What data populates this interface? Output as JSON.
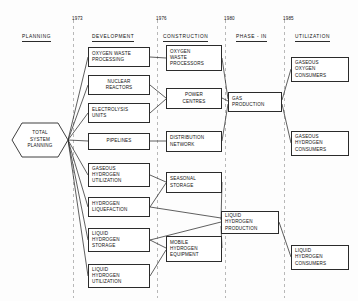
{
  "diagram": {
    "phases": [
      {
        "label": "PLANNING",
        "x": 22,
        "y": 34
      },
      {
        "label": "DEVELOPMENT",
        "x": 92,
        "y": 34
      },
      {
        "label": "CONSTRUCTION",
        "x": 163,
        "y": 34
      },
      {
        "label": "PHASE - IN",
        "x": 236,
        "y": 34
      },
      {
        "label": "UTILIZATION",
        "x": 295,
        "y": 34
      }
    ],
    "years": [
      {
        "label": "1973",
        "x": 72,
        "y": 16
      },
      {
        "label": "1976",
        "x": 156,
        "y": 16
      },
      {
        "label": "1980",
        "x": 224,
        "y": 16
      },
      {
        "label": "1985",
        "x": 283,
        "y": 16
      }
    ],
    "dividers": [
      {
        "x": 73.5
      },
      {
        "x": 157.5
      },
      {
        "x": 225.5
      },
      {
        "x": 284.5
      }
    ],
    "root": {
      "id": "total-system-planning",
      "lines": [
        "TOTAL",
        "SYSTEM",
        "PLANNING"
      ],
      "x": 12,
      "y": 123,
      "w": 56,
      "h": 34
    },
    "nodes": [
      {
        "id": "oxygen-waste-processing",
        "column": "development",
        "lines": [
          "OXYGEN WASTE",
          "PROCESSING"
        ],
        "x": 88,
        "y": 47,
        "w": 62,
        "h": 20
      },
      {
        "id": "nuclear-reactors",
        "column": "development",
        "lines": [
          "NUCLEAR",
          "REACTORS"
        ],
        "x": 88,
        "y": 75,
        "w": 62,
        "h": 20,
        "centered": true
      },
      {
        "id": "electrolysis-units",
        "column": "development",
        "lines": [
          "ELECTROLYSIS",
          "UNITS"
        ],
        "x": 88,
        "y": 103,
        "w": 62,
        "h": 20
      },
      {
        "id": "pipelines",
        "column": "development",
        "lines": [
          "PIPELINES"
        ],
        "x": 88,
        "y": 133,
        "w": 62,
        "h": 17,
        "centered": true
      },
      {
        "id": "gaseous-hydrogen-utilization",
        "column": "development",
        "lines": [
          "GASEOUS",
          "HYDROGEN",
          "UTILIZATION"
        ],
        "x": 88,
        "y": 163,
        "w": 62,
        "h": 24
      },
      {
        "id": "hydrogen-liquefaction",
        "column": "development",
        "lines": [
          "HYDROGEN",
          "LIQUEFACTION"
        ],
        "x": 88,
        "y": 197,
        "w": 62,
        "h": 20
      },
      {
        "id": "liquid-hydrogen-storage",
        "column": "development",
        "lines": [
          "LIQUID",
          "HYDROGEN",
          "STORAGE"
        ],
        "x": 88,
        "y": 228,
        "w": 62,
        "h": 24
      },
      {
        "id": "liquid-hydrogen-utilization",
        "column": "development",
        "lines": [
          "LIQUID",
          "HYDROGEN",
          "UTILIZATION"
        ],
        "x": 88,
        "y": 264,
        "w": 62,
        "h": 24
      },
      {
        "id": "oxygen-waste-processors",
        "column": "construction",
        "lines": [
          "OXYGEN",
          "WASTE",
          "PROCESSORS"
        ],
        "x": 166,
        "y": 45,
        "w": 56,
        "h": 26
      },
      {
        "id": "power-centres",
        "column": "construction",
        "lines": [
          "POWER",
          "CENTRES"
        ],
        "x": 166,
        "y": 88,
        "w": 56,
        "h": 21,
        "centered": true
      },
      {
        "id": "distribution-network",
        "column": "construction",
        "lines": [
          "DISTRIBUTION",
          "NETWORK"
        ],
        "x": 166,
        "y": 131,
        "w": 56,
        "h": 21
      },
      {
        "id": "seasonal-storage",
        "column": "construction",
        "lines": [
          "SEASONAL",
          "STORAGE"
        ],
        "x": 166,
        "y": 172,
        "w": 56,
        "h": 21
      },
      {
        "id": "mobile-hydrogen-equipment",
        "column": "construction",
        "lines": [
          "MOBILE",
          "HYDROGEN",
          "EQUIPMENT"
        ],
        "x": 166,
        "y": 236,
        "w": 56,
        "h": 26
      },
      {
        "id": "gas-production",
        "column": "phase-in",
        "lines": [
          "GAS",
          "PRODUCTION"
        ],
        "x": 228,
        "y": 92,
        "w": 54,
        "h": 20
      },
      {
        "id": "liquid-hydrogen-production",
        "column": "phase-in",
        "lines": [
          "LIQUID",
          "HYDROGEN",
          "PRODUCTION"
        ],
        "x": 221,
        "y": 211,
        "w": 58,
        "h": 23
      },
      {
        "id": "gaseous-oxygen-consumers",
        "column": "utilization",
        "lines": [
          "GASEOUS",
          "OXYGEN",
          "CONSUMERS"
        ],
        "x": 291,
        "y": 57,
        "w": 58,
        "h": 25
      },
      {
        "id": "gaseous-hydrogen-consumers",
        "column": "utilization",
        "lines": [
          "GASEOUS",
          "HYDROGEN",
          "CONSUMERS"
        ],
        "x": 291,
        "y": 131,
        "w": 58,
        "h": 25
      },
      {
        "id": "liquid-hydrogen-consumers",
        "column": "utilization",
        "lines": [
          "LIQUID",
          "HYDROGEN",
          "CONSUMERS"
        ],
        "x": 291,
        "y": 245,
        "w": 58,
        "h": 25
      }
    ],
    "edges": [
      {
        "from": "total-system-planning",
        "to": "oxygen-waste-processing",
        "path": "M68,140 L88,57"
      },
      {
        "from": "total-system-planning",
        "to": "nuclear-reactors",
        "path": "M68,140 L88,85"
      },
      {
        "from": "total-system-planning",
        "to": "electrolysis-units",
        "path": "M68,140 L88,113"
      },
      {
        "from": "total-system-planning",
        "to": "pipelines",
        "path": "M68,140 L88,141"
      },
      {
        "from": "total-system-planning",
        "to": "gaseous-hydrogen-utilization",
        "path": "M68,140 L88,175"
      },
      {
        "from": "total-system-planning",
        "to": "hydrogen-liquefaction",
        "path": "M68,140 L88,207"
      },
      {
        "from": "total-system-planning",
        "to": "liquid-hydrogen-storage",
        "path": "M68,140 L88,240"
      },
      {
        "from": "total-system-planning",
        "to": "liquid-hydrogen-utilization",
        "path": "M68,140 L88,276"
      },
      {
        "from": "oxygen-waste-processing",
        "to": "oxygen-waste-processors",
        "path": "M150,57 L166,58"
      },
      {
        "from": "nuclear-reactors",
        "to": "power-centres",
        "path": "M150,85 L166,98"
      },
      {
        "from": "electrolysis-units",
        "to": "power-centres",
        "path": "M150,113 L166,99"
      },
      {
        "from": "pipelines",
        "to": "distribution-network",
        "path": "M150,141 L166,141"
      },
      {
        "from": "gaseous-hydrogen-utilization",
        "to": "seasonal-storage",
        "path": "M150,175 L166,182"
      },
      {
        "from": "hydrogen-liquefaction",
        "to": "seasonal-storage",
        "path": "M150,207 L166,183"
      },
      {
        "from": "liquid-hydrogen-storage",
        "to": "mobile-hydrogen-equipment",
        "path": "M150,240 L166,248"
      },
      {
        "from": "liquid-hydrogen-utilization",
        "to": "mobile-hydrogen-equipment",
        "path": "M150,276 L166,250"
      },
      {
        "from": "oxygen-waste-processors",
        "to": "gas-production",
        "path": "M222,58 L228,99"
      },
      {
        "from": "power-centres",
        "to": "gas-production",
        "path": "M222,98 L228,101"
      },
      {
        "from": "distribution-network",
        "to": "gas-production",
        "path": "M222,141 L228,104"
      },
      {
        "from": "hydrogen-liquefaction",
        "to": "liquid-hydrogen-production",
        "path": "M150,207 L221,218"
      },
      {
        "from": "seasonal-storage",
        "to": "liquid-hydrogen-production",
        "path": "M222,182 L221,220"
      },
      {
        "from": "liquid-hydrogen-storage",
        "to": "liquid-hydrogen-production",
        "path": "M150,240 L221,222"
      },
      {
        "from": "mobile-hydrogen-equipment",
        "to": "liquid-hydrogen-production",
        "path": "M222,248 L221,226"
      },
      {
        "from": "gas-production",
        "to": "gaseous-oxygen-consumers",
        "path": "M282,100 L291,69"
      },
      {
        "from": "gas-production",
        "to": "gaseous-hydrogen-consumers",
        "path": "M282,104 L291,143"
      },
      {
        "from": "liquid-hydrogen-production",
        "to": "liquid-hydrogen-consumers",
        "path": "M279,222 L291,257"
      }
    ]
  }
}
